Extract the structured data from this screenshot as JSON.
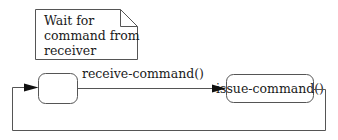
{
  "diagram": {
    "type": "UML state machine",
    "note": {
      "lines": [
        "Wait for",
        "command from",
        "receiver"
      ]
    },
    "states": [
      {
        "id": "idle",
        "label": ""
      },
      {
        "id": "issue",
        "label": "issue-command()"
      }
    ],
    "transitions": [
      {
        "from": "idle",
        "to": "issue",
        "label": "receive-command()"
      },
      {
        "from": "issue",
        "to": "idle",
        "label": ""
      }
    ],
    "colors": {
      "stroke": "#555555",
      "text": "#1a1a1a",
      "background": "#ffffff"
    }
  }
}
